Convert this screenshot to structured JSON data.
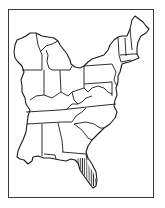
{
  "map": {
    "subject": "Eastern United States outline map",
    "region_shown": "States east of the Mississippi River",
    "highlighted_region": "Peninsular Florida",
    "highlight_style": "vertical hatching",
    "colors": {
      "outline": "#1a1a1a",
      "frame": "#3a3a3a",
      "background": "#ffffff",
      "hatch": "#1a1a1a"
    }
  }
}
